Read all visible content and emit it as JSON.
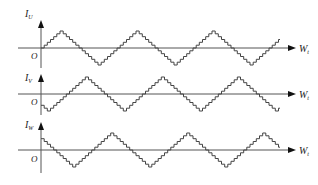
{
  "diagram": {
    "panels": [
      {
        "id": "u",
        "y_label": "I",
        "y_sub": "U",
        "x_label": "W",
        "x_sub": "t",
        "origin": "O",
        "phase_deg": 0,
        "start_value": 0
      },
      {
        "id": "v",
        "y_label": "I",
        "y_sub": "V",
        "x_label": "W",
        "x_sub": "t",
        "origin": "O",
        "phase_deg": -120,
        "start_value": -0.87
      },
      {
        "id": "w",
        "y_label": "I",
        "y_sub": "W",
        "x_label": "W",
        "x_sub": "t",
        "origin": "O",
        "phase_deg": 120,
        "start_value": 0.87
      }
    ],
    "waveform": {
      "shape": "stepped-triangle",
      "steps_per_quarter": 6,
      "periods_shown": 3
    },
    "colors": {
      "axis": "#555555",
      "wave": "#444444",
      "text": "#222222"
    }
  }
}
